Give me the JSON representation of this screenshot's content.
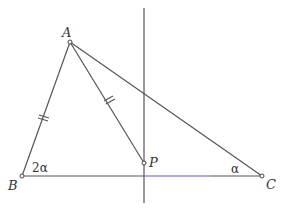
{
  "diagram": {
    "type": "geometry",
    "points": {
      "A": {
        "label": "A",
        "x": 70,
        "y": 42
      },
      "B": {
        "label": "B",
        "x": 22,
        "y": 176
      },
      "C": {
        "label": "C",
        "x": 262,
        "y": 176
      },
      "P": {
        "label": "P",
        "x": 144,
        "y": 163
      }
    },
    "angles": {
      "B": {
        "label": "2α"
      },
      "C": {
        "label": "α"
      }
    },
    "segments": [
      "AB",
      "AC",
      "AP",
      "BC"
    ],
    "equal_marks": [
      "AB",
      "AP"
    ],
    "vertical_line": {
      "x": 144,
      "y1": 8,
      "y2": 203
    },
    "colors": {
      "line": "#555555",
      "base_highlight": "#5a5ad0",
      "text": "#333333"
    }
  }
}
